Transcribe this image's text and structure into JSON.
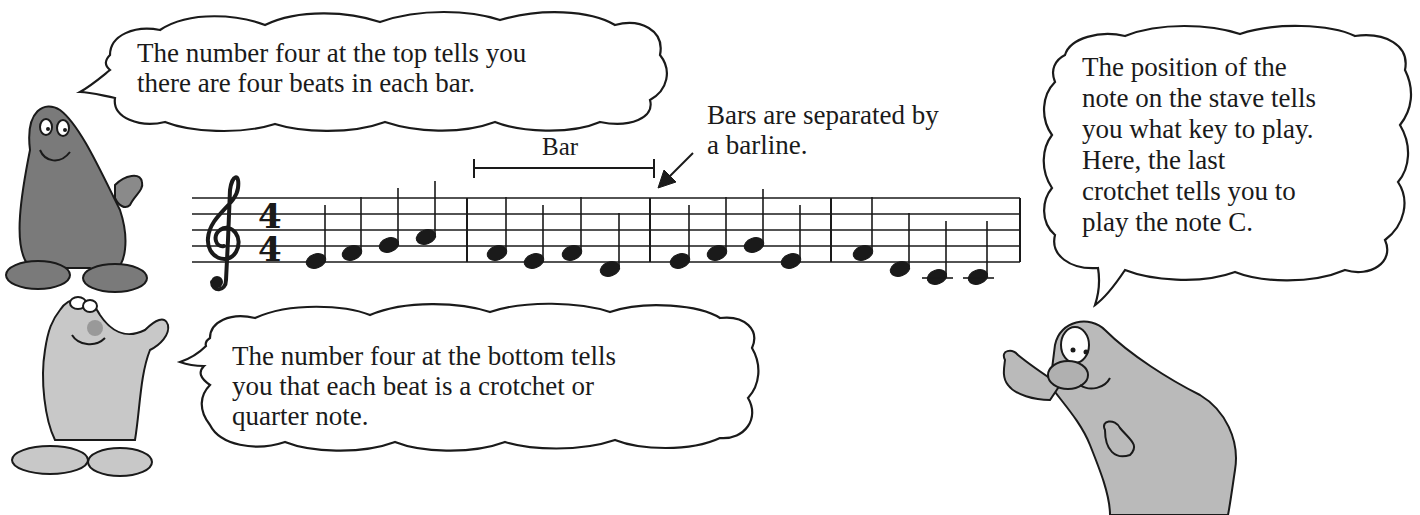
{
  "bubbles": {
    "top_left": {
      "lines": [
        "The number four at the top tells you",
        "there are four beats in each bar."
      ]
    },
    "bottom_left": {
      "lines": [
        "The number four at the bottom tells",
        "you that each beat is a crotchet or",
        "quarter note."
      ]
    },
    "right": {
      "lines": [
        "The position of the",
        "note on the stave tells",
        "you what key to play.",
        "Here, the last",
        "crotchet tells you to",
        "play the note C."
      ]
    }
  },
  "annotations": {
    "bar_label": "Bar",
    "barline_note_lines": [
      "Bars are separated by",
      "a barline."
    ]
  },
  "stave": {
    "clef": "treble",
    "time_signature": {
      "top": "4",
      "bottom": "4"
    },
    "bars": [
      {
        "notes": [
          "E4",
          "F4",
          "G4",
          "A4"
        ]
      },
      {
        "notes": [
          "F4",
          "E4",
          "F4",
          "D4"
        ]
      },
      {
        "notes": [
          "E4",
          "F4",
          "G4",
          "E4"
        ]
      },
      {
        "notes": [
          "F4",
          "D4",
          "C4",
          "C4"
        ]
      }
    ],
    "note_type": "crotchet"
  },
  "characters": [
    {
      "name": "dark-character",
      "color": "#7a7a7a"
    },
    {
      "name": "light-character",
      "color": "#c4c4c4"
    },
    {
      "name": "pointing-character",
      "color": "#b9b9b9"
    }
  ]
}
